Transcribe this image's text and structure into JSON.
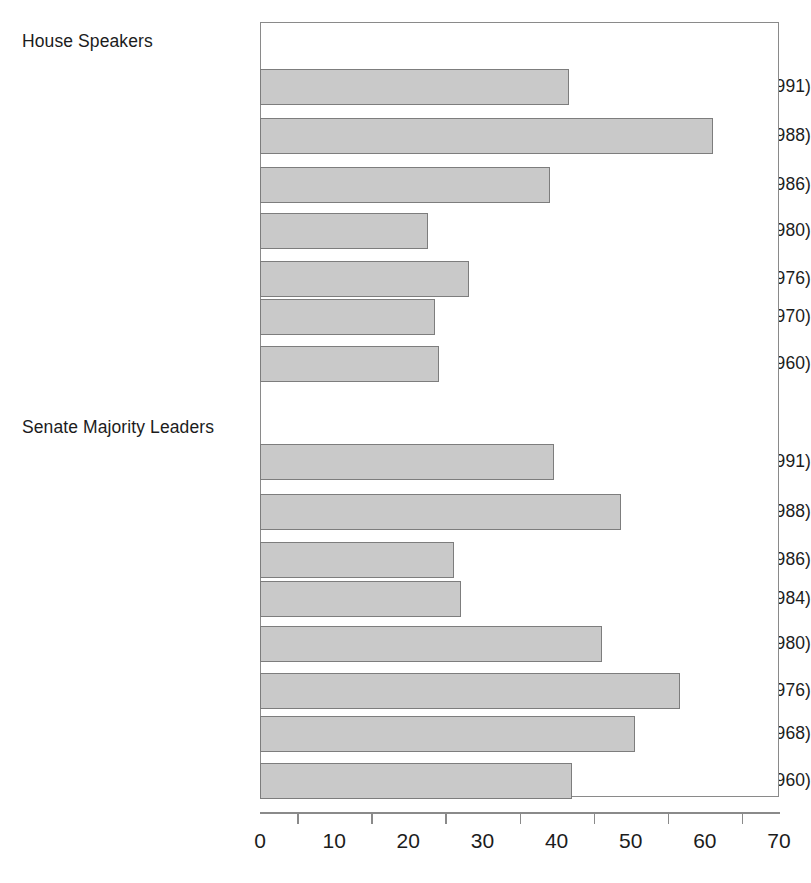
{
  "chart_data": {
    "type": "bar",
    "orientation": "horizontal",
    "title": "",
    "xlabel": "",
    "ylabel": "",
    "xlim": [
      0,
      70
    ],
    "grid": false,
    "legend": false,
    "x_major_ticks": [
      0,
      10,
      20,
      30,
      40,
      50,
      60,
      70
    ],
    "x_minor_ticks": [
      5,
      15,
      25,
      35,
      45,
      55,
      65
    ],
    "x_tick_labels": [
      "0",
      "10",
      "20",
      "30",
      "40",
      "50",
      "60",
      "70"
    ],
    "bar_fill_color": "#c9c9c9",
    "bar_edge_color": "#7d7d7d",
    "axis_color": "#8a8a8a",
    "groups": [
      {
        "name": "House Speakers",
        "label": "House Speakers",
        "items": [
          {
            "label": "Foley (1989–1991)",
            "value": 41.5
          },
          {
            "label": "Wright (1987–1988)",
            "value": 61.0
          },
          {
            "label": "O’Neill (1981–1986)",
            "value": 39.0
          },
          {
            "label": "O’Neill (1977–1980)",
            "value": 22.5
          },
          {
            "label": "Albert (1971–1976)",
            "value": 28.0
          },
          {
            "label": "McCormack (1968–1970)",
            "value": 23.5
          },
          {
            "label": "Rayburn (1955–1960)",
            "value": 24.0
          }
        ]
      },
      {
        "name": "Senate Majority Leaders",
        "label": "Senate Majority Leaders",
        "items": [
          {
            "label": "Mitchell (1989–1991)",
            "value": 39.5
          },
          {
            "label": "Byrd (1987–1988)",
            "value": 48.5
          },
          {
            "label": "Dole (1985–1986)",
            "value": 26.0
          },
          {
            "label": "Baker (1981–1984)",
            "value": 27.0
          },
          {
            "label": "Byrd (1977–1980)",
            "value": 46.0
          },
          {
            "label": "Mansfield (1969–1976)",
            "value": 56.5
          },
          {
            "label": "Mansfield (1961–1968)",
            "value": 50.5
          },
          {
            "label": "Johnson (1955–1960)",
            "value": 42.0
          }
        ]
      }
    ]
  },
  "layout": {
    "plot_left": 260,
    "plot_top": 22,
    "plot_width": 519,
    "plot_height": 775,
    "rows": [
      {
        "kind": "group",
        "group": 0,
        "text_y": 33
      },
      {
        "kind": "bar",
        "group": 0,
        "index": 0,
        "bar_top": 68,
        "bar_height": 36,
        "text_y": 78
      },
      {
        "kind": "bar",
        "group": 0,
        "index": 1,
        "bar_top": 117,
        "bar_height": 36,
        "text_y": 127
      },
      {
        "kind": "bar",
        "group": 0,
        "index": 2,
        "bar_top": 166,
        "bar_height": 36,
        "text_y": 176
      },
      {
        "kind": "bar",
        "group": 0,
        "index": 3,
        "bar_top": 212,
        "bar_height": 36,
        "text_y": 222
      },
      {
        "kind": "bar",
        "group": 0,
        "index": 4,
        "bar_top": 260,
        "bar_height": 36,
        "text_y": 270
      },
      {
        "kind": "bar",
        "group": 0,
        "index": 5,
        "bar_top": 298,
        "bar_height": 36,
        "text_y": 308
      },
      {
        "kind": "bar",
        "group": 0,
        "index": 6,
        "bar_top": 345,
        "bar_height": 36,
        "text_y": 355
      },
      {
        "kind": "group",
        "group": 1,
        "text_y": 419
      },
      {
        "kind": "bar",
        "group": 1,
        "index": 0,
        "bar_top": 443,
        "bar_height": 36,
        "text_y": 453
      },
      {
        "kind": "bar",
        "group": 1,
        "index": 1,
        "bar_top": 493,
        "bar_height": 36,
        "text_y": 503
      },
      {
        "kind": "bar",
        "group": 1,
        "index": 2,
        "bar_top": 541,
        "bar_height": 36,
        "text_y": 551
      },
      {
        "kind": "bar",
        "group": 1,
        "index": 3,
        "bar_top": 580,
        "bar_height": 36,
        "text_y": 590
      },
      {
        "kind": "bar",
        "group": 1,
        "index": 4,
        "bar_top": 625,
        "bar_height": 36,
        "text_y": 635
      },
      {
        "kind": "bar",
        "group": 1,
        "index": 5,
        "bar_top": 672,
        "bar_height": 36,
        "text_y": 682
      },
      {
        "kind": "bar",
        "group": 1,
        "index": 6,
        "bar_top": 715,
        "bar_height": 36,
        "text_y": 725
      },
      {
        "kind": "bar",
        "group": 1,
        "index": 7,
        "bar_top": 762,
        "bar_height": 36,
        "text_y": 772
      }
    ]
  }
}
